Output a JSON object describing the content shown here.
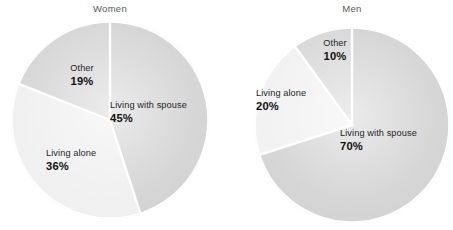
{
  "figure": {
    "background": "#ffffff",
    "width": 453,
    "height": 230
  },
  "charts": [
    {
      "id": "women",
      "title": "Women",
      "slices": [
        {
          "label": "Living with spouse",
          "percent": "45%",
          "value": 45,
          "color": "#d2d2d2"
        },
        {
          "label": "Living alone",
          "percent": "36%",
          "value": 36,
          "color": "#efefef"
        },
        {
          "label": "Other",
          "percent": "19%",
          "value": 19,
          "color": "#d4d4d4"
        }
      ]
    },
    {
      "id": "men",
      "title": "Men",
      "slices": [
        {
          "label": "Living with spouse",
          "percent": "70%",
          "value": 70,
          "color": "#d2d2d2"
        },
        {
          "label": "Living alone",
          "percent": "20%",
          "value": 20,
          "color": "#f1f1f1"
        },
        {
          "label": "Other",
          "percent": "10%",
          "value": 10,
          "color": "#d6d6d6"
        }
      ]
    }
  ],
  "chart_data": {
    "type": "pie",
    "title": "",
    "subtitle": "",
    "xlabel": "",
    "ylabel": "",
    "grid": false,
    "legend_position": "none",
    "annotations": "Each wedge is labelled in place with its category name and percentage.",
    "charts": [
      {
        "title": "Women",
        "categories": [
          "Living with spouse",
          "Living alone",
          "Other"
        ],
        "values": [
          45,
          36,
          19
        ],
        "value_labels": [
          "45%",
          "36%",
          "19%"
        ],
        "units": "percent",
        "start_angle_deg": 0,
        "direction": "clockwise",
        "colors": [
          "#d2d2d2",
          "#efefef",
          "#d4d4d4"
        ]
      },
      {
        "title": "Men",
        "categories": [
          "Living with spouse",
          "Living alone",
          "Other"
        ],
        "values": [
          70,
          20,
          10
        ],
        "value_labels": [
          "70%",
          "20%",
          "10%"
        ],
        "units": "percent",
        "start_angle_deg": 0,
        "direction": "clockwise",
        "colors": [
          "#d2d2d2",
          "#f1f1f1",
          "#d6d6d6"
        ]
      }
    ]
  }
}
